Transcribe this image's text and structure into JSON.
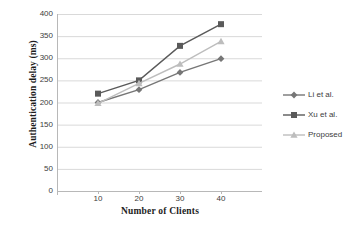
{
  "chart_data": {
    "type": "line",
    "title": "",
    "xlabel": "Number of Clients",
    "ylabel": "Authentication delay (ms)",
    "categories": [
      10,
      20,
      30,
      40
    ],
    "x": [
      10,
      20,
      30,
      40
    ],
    "xlim": [
      0,
      50
    ],
    "ylim": [
      0,
      400
    ],
    "yticks": [
      0,
      50,
      100,
      150,
      200,
      250,
      300,
      350,
      400
    ],
    "xticks": [
      10,
      20,
      30,
      40
    ],
    "grid": "horizontal",
    "legend_position": "right",
    "series": [
      {
        "name": "Li et al.",
        "values": [
          200,
          229,
          268,
          299
        ],
        "color": "#767676",
        "marker": "diamond"
      },
      {
        "name": "Xu et al.",
        "values": [
          220,
          250,
          328,
          377
        ],
        "color": "#5a5a5a",
        "marker": "square"
      },
      {
        "name": "Proposed",
        "values": [
          198,
          243,
          287,
          338
        ],
        "color": "#bdbdbd",
        "marker": "triangle"
      }
    ]
  },
  "axis": {
    "y_tick_labels": [
      "400",
      "350",
      "300",
      "250",
      "200",
      "150",
      "100",
      "50",
      "0"
    ],
    "x_tick_labels": [
      "10",
      "20",
      "30",
      "40"
    ],
    "y_title": "Authentication delay (ms)",
    "x_title": "Number of Clients"
  },
  "legend": {
    "items": [
      {
        "label": "Li et al."
      },
      {
        "label": "Xu et al."
      },
      {
        "label": "Proposed"
      }
    ]
  },
  "colors": {
    "series_li": "#767676",
    "series_xu": "#5a5a5a",
    "series_proposed": "#bdbdbd",
    "gridline": "#d9d9d9",
    "axis": "#b8b8b8",
    "text": "#3d3d3d",
    "background": "#ffffff"
  }
}
